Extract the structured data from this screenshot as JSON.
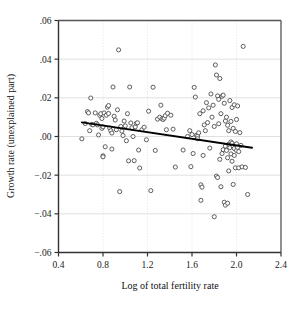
{
  "chart_data": {
    "type": "scatter",
    "title": "",
    "xlabel": "Log of total fertility rate",
    "ylabel": "Growth rate (unexplained part)",
    "xlim": [
      0.4,
      2.4
    ],
    "ylim": [
      -0.06,
      0.06
    ],
    "xticks": [
      0.4,
      0.8,
      1.2,
      1.6,
      2.0,
      2.4
    ],
    "xtick_labels": [
      "0.4",
      "0.8",
      "1.2",
      "1.6",
      "2.0",
      "2.4"
    ],
    "yticks": [
      0.06,
      0.04,
      0.02,
      0.0,
      -0.02,
      -0.04,
      -0.06
    ],
    "ytick_labels": [
      ".06",
      ".04",
      ".02",
      ".00",
      "−.02",
      "−.04",
      "−.06"
    ],
    "grid": true,
    "grid_color": "#d8d8d8",
    "legend": "none",
    "marker": "open-circle",
    "marker_color": "#444444",
    "marker_fill": "#ffffff",
    "fit_line": {
      "type": "linear",
      "color": "#000000",
      "x_start": 0.61,
      "y_start": 0.0073,
      "x_end": 2.14,
      "y_end": -0.0058
    },
    "points": [
      [
        0.61,
        -0.0012
      ],
      [
        0.64,
        0.0067
      ],
      [
        0.66,
        0.0129
      ],
      [
        0.67,
        0.0122
      ],
      [
        0.68,
        0.003
      ],
      [
        0.69,
        0.0199
      ],
      [
        0.7,
        0.0062
      ],
      [
        0.71,
        0.006
      ],
      [
        0.73,
        0.0122
      ],
      [
        0.74,
        0.0068
      ],
      [
        0.75,
        0.006
      ],
      [
        0.76,
        0.0008
      ],
      [
        0.77,
        0.011
      ],
      [
        0.78,
        0.0118
      ],
      [
        0.79,
        0.0042
      ],
      [
        0.79,
        0.0093
      ],
      [
        0.8,
        0.005
      ],
      [
        0.8,
        -0.01
      ],
      [
        0.8,
        -0.0105
      ],
      [
        0.81,
        0.0122
      ],
      [
        0.82,
        -0.0053
      ],
      [
        0.83,
        0.011
      ],
      [
        0.84,
        0.0152
      ],
      [
        0.85,
        0.016
      ],
      [
        0.85,
        0.0119
      ],
      [
        0.86,
        0.0044
      ],
      [
        0.87,
        0.003
      ],
      [
        0.88,
        0.0018
      ],
      [
        0.88,
        -0.0065
      ],
      [
        0.89,
        0.0256
      ],
      [
        0.9,
        0.0105
      ],
      [
        0.91,
        0.0085
      ],
      [
        0.92,
        0.0035
      ],
      [
        0.93,
        0.0138
      ],
      [
        0.94,
        0.0448
      ],
      [
        0.95,
        -0.0285
      ],
      [
        0.96,
        0.0052
      ],
      [
        0.97,
        0.0028
      ],
      [
        0.98,
        0.0005
      ],
      [
        0.99,
        0.008
      ],
      [
        1.0,
        0.0055
      ],
      [
        1.01,
        -0.0022
      ],
      [
        1.02,
        0.0118
      ],
      [
        1.03,
        -0.0126
      ],
      [
        1.04,
        0.0256
      ],
      [
        1.05,
        0.007
      ],
      [
        1.06,
        0.0045
      ],
      [
        1.07,
        0.0
      ],
      [
        1.08,
        -0.0125
      ],
      [
        1.09,
        0.005
      ],
      [
        1.1,
        0.0068
      ],
      [
        1.11,
        0.0071
      ],
      [
        1.12,
        -0.007
      ],
      [
        1.13,
        -0.0163
      ],
      [
        1.15,
        0.0035
      ],
      [
        1.17,
        0.0048
      ],
      [
        1.19,
        -0.0017
      ],
      [
        1.21,
        0.0131
      ],
      [
        1.23,
        -0.028
      ],
      [
        1.25,
        0.0255
      ],
      [
        1.27,
        -0.0072
      ],
      [
        1.29,
        0.009
      ],
      [
        1.31,
        0.01
      ],
      [
        1.32,
        0.0162
      ],
      [
        1.33,
        0.0092
      ],
      [
        1.34,
        0.0088
      ],
      [
        1.35,
        0.0095
      ],
      [
        1.36,
        0.0108
      ],
      [
        1.37,
        0.0035
      ],
      [
        1.38,
        0.012
      ],
      [
        1.41,
        0.011
      ],
      [
        1.43,
        0.0038
      ],
      [
        1.45,
        -0.0158
      ],
      [
        1.52,
        -0.007
      ],
      [
        1.56,
        0.0
      ],
      [
        1.58,
        0.003
      ],
      [
        1.59,
        -0.0156
      ],
      [
        1.6,
        0.001
      ],
      [
        1.61,
        -0.0088
      ],
      [
        1.62,
        0.0254
      ],
      [
        1.63,
        0.0204
      ],
      [
        1.64,
        0.0006
      ],
      [
        1.65,
        0.0002
      ],
      [
        1.65,
        -0.0011
      ],
      [
        1.66,
        0.0019
      ],
      [
        1.67,
        0.0118
      ],
      [
        1.68,
        -0.025
      ],
      [
        1.68,
        -0.033
      ],
      [
        1.69,
        -0.0262
      ],
      [
        1.7,
        0.0133
      ],
      [
        1.7,
        -0.0098
      ],
      [
        1.71,
        0.006
      ],
      [
        1.72,
        0.003
      ],
      [
        1.73,
        0.0175
      ],
      [
        1.74,
        0.0072
      ],
      [
        1.75,
        0.0148
      ],
      [
        1.76,
        -0.006
      ],
      [
        1.77,
        0.022
      ],
      [
        1.78,
        0.01
      ],
      [
        1.79,
        0.0162
      ],
      [
        1.8,
        0.0052
      ],
      [
        1.8,
        -0.0415
      ],
      [
        1.81,
        0.037
      ],
      [
        1.82,
        0.0318
      ],
      [
        1.82,
        -0.0205
      ],
      [
        1.83,
        0.021
      ],
      [
        1.83,
        -0.0212
      ],
      [
        1.84,
        0.0192
      ],
      [
        1.84,
        0.0066
      ],
      [
        1.85,
        0.03
      ],
      [
        1.85,
        -0.0118
      ],
      [
        1.86,
        0.0118
      ],
      [
        1.86,
        -0.026
      ],
      [
        1.87,
        0.0208
      ],
      [
        1.87,
        -0.0088
      ],
      [
        1.88,
        0.0214
      ],
      [
        1.88,
        -0.0068
      ],
      [
        1.89,
        0.0172
      ],
      [
        1.89,
        -0.034
      ],
      [
        1.9,
        0.008
      ],
      [
        1.9,
        -0.005
      ],
      [
        1.9,
        -0.0355
      ],
      [
        1.91,
        0.01
      ],
      [
        1.91,
        -0.0072
      ],
      [
        1.92,
        0.0058
      ],
      [
        1.92,
        -0.011
      ],
      [
        1.92,
        -0.0345
      ],
      [
        1.93,
        0.003
      ],
      [
        1.93,
        -0.004
      ],
      [
        1.93,
        -0.0178
      ],
      [
        1.94,
        0.0186
      ],
      [
        1.94,
        -0.0058
      ],
      [
        1.95,
        0.0078
      ],
      [
        1.95,
        -0.0028
      ],
      [
        1.95,
        -0.009
      ],
      [
        1.96,
        0.015
      ],
      [
        1.96,
        -0.0035
      ],
      [
        1.96,
        -0.0128
      ],
      [
        1.97,
        0.0042
      ],
      [
        1.97,
        -0.005
      ],
      [
        1.97,
        -0.0248
      ],
      [
        1.98,
        0.0164
      ],
      [
        1.98,
        -0.0062
      ],
      [
        1.98,
        -0.0098
      ],
      [
        1.99,
        0.0026
      ],
      [
        1.99,
        -0.0044
      ],
      [
        1.99,
        -0.0162
      ],
      [
        2.0,
        0.0088
      ],
      [
        2.0,
        -0.0038
      ],
      [
        2.0,
        -0.0072
      ],
      [
        2.01,
        0.0158
      ],
      [
        2.01,
        -0.0056
      ],
      [
        2.02,
        -0.0078
      ],
      [
        2.02,
        -0.0162
      ],
      [
        2.03,
        0.002
      ],
      [
        2.04,
        -0.0046
      ],
      [
        2.05,
        -0.0157
      ],
      [
        2.06,
        0.0466
      ],
      [
        2.08,
        -0.016
      ],
      [
        2.1,
        -0.03
      ]
    ]
  },
  "axes": {
    "x_title": "Log of total fertility rate",
    "y_title": "Growth rate (unexplained part)"
  }
}
